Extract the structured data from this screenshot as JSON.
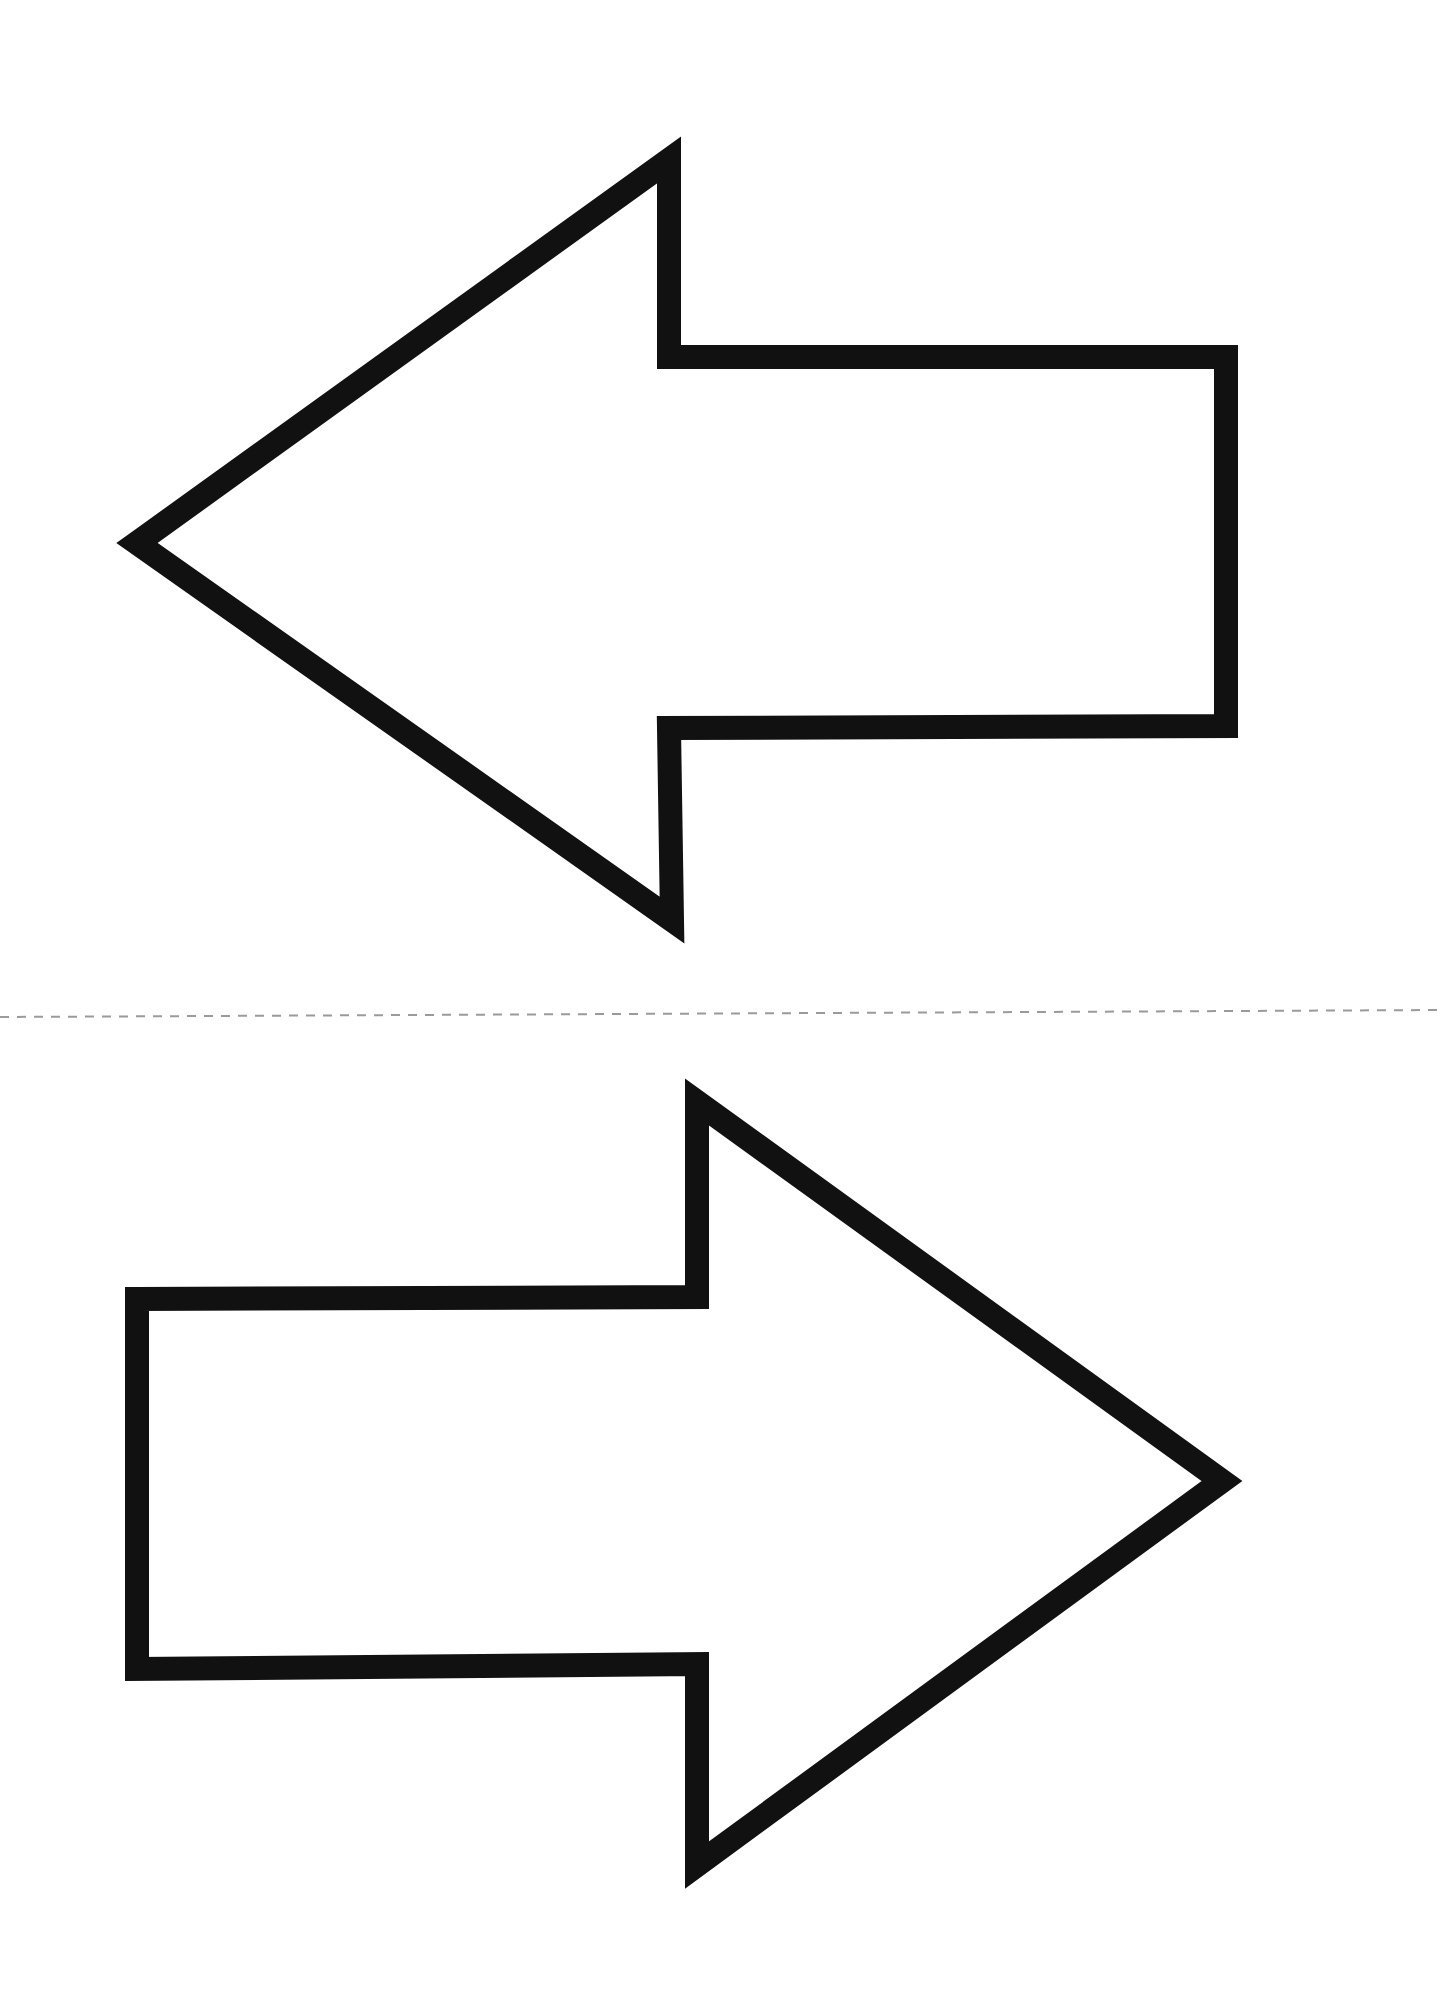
{
  "page": {
    "background": "#ffffff",
    "width": 1441,
    "height": 2009
  },
  "cut_line": {
    "style": "dashed",
    "color": "#9a9a9a",
    "y_left": 1017,
    "y_right": 1010
  },
  "arrows": [
    {
      "direction": "left",
      "stroke": "#111111",
      "stroke_width": 24,
      "fill": "#ffffff",
      "points": "137,543 669,160 669,357 1226,357 1226,726 669,728 672,920"
    },
    {
      "direction": "right",
      "stroke": "#111111",
      "stroke_width": 24,
      "fill": "#ffffff",
      "points": "137,1299 697,1297 697,1102 1222,1481 697,1865 697,1664 137,1669"
    }
  ]
}
